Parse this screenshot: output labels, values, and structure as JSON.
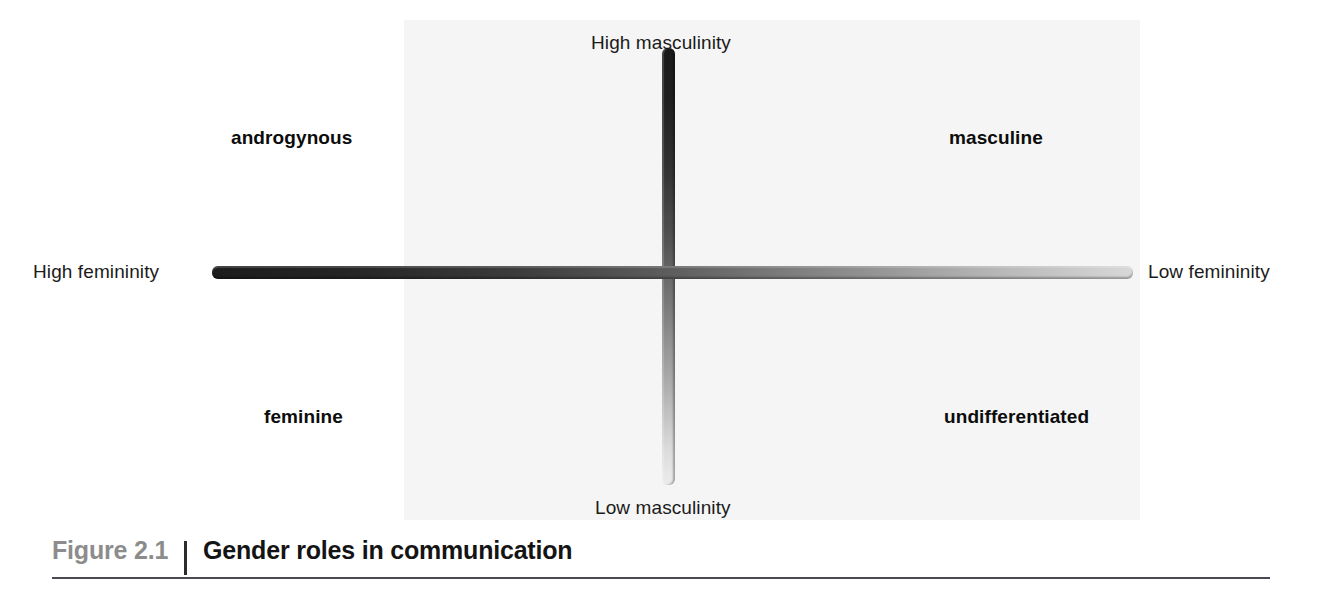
{
  "figure": {
    "caption": {
      "number": "Figure 2.1",
      "title": "Gender roles in communication"
    },
    "chart_data": {
      "type": "scatter",
      "title": "Gender roles in communication",
      "subtitle": "",
      "xlabel": "Femininity",
      "ylabel": "Masculinity",
      "grid": false,
      "legend_position": "none",
      "axes": [
        {
          "name": "horizontal-axis",
          "orientation": "horizontal",
          "low_end_label": "Low femininity",
          "high_end_label": "High femininity",
          "high_end_side": "left",
          "low_end_side": "right",
          "gradient_from": "#1c1c1c",
          "gradient_to": "#d8d8d8"
        },
        {
          "name": "vertical-axis",
          "orientation": "vertical",
          "high_end_label": "High masculinity",
          "low_end_label": "Low masculinity",
          "high_end_side": "top",
          "low_end_side": "bottom",
          "gradient_from": "#1a1a1a",
          "gradient_to": "#ececec"
        }
      ],
      "axis_labels": {
        "top": "High masculinity",
        "bottom": "Low masculinity",
        "left": "High femininity",
        "right": "Low femininity"
      },
      "quadrants": [
        {
          "id": "androgynous",
          "label": "androgynous",
          "position": "top-left",
          "femininity": "high",
          "masculinity": "high"
        },
        {
          "id": "masculine",
          "label": "masculine",
          "position": "top-right",
          "femininity": "low",
          "masculinity": "high"
        },
        {
          "id": "feminine",
          "label": "feminine",
          "position": "bottom-left",
          "femininity": "high",
          "masculinity": "low"
        },
        {
          "id": "undifferentiated",
          "label": "undifferentiated",
          "position": "bottom-right",
          "femininity": "low",
          "masculinity": "low"
        }
      ]
    },
    "colors": {
      "page_background": "#ffffff",
      "plot_plate": "#f5f5f5",
      "caption_number": "#8c8c8c",
      "caption_title": "#141414",
      "caption_rule": "#4a4a55",
      "text": "#1b1b1b"
    }
  }
}
